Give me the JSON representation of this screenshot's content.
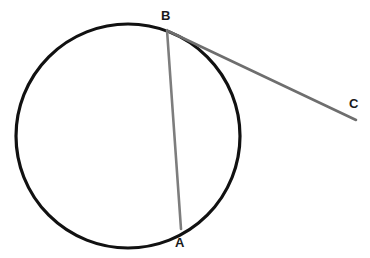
{
  "figure": {
    "type": "geometry-diagram",
    "background_color": "#ffffff",
    "width": 370,
    "height": 258
  },
  "labels": {
    "a": "A",
    "b": "B",
    "c": "C"
  },
  "colors": {
    "circle_stroke": "#111111",
    "chord_stroke": "#7d7d7d",
    "tangent_stroke": "#6e6e6e",
    "label_text": "#1a1a1a"
  },
  "geometry": {
    "circle": {
      "name": "circle",
      "cx": 128,
      "cy": 136,
      "r": 112,
      "stroke_width": 3.2
    },
    "chord_ab": {
      "name": "chord-AB",
      "x1": 167,
      "y1": 30,
      "x2": 181,
      "y2": 229,
      "stroke_width": 2.6
    },
    "tangent_bc": {
      "name": "tangent-BC",
      "x1": 168,
      "y1": 31,
      "x2": 356,
      "y2": 120,
      "stroke_width": 2.6
    },
    "points": {
      "a": {
        "x": 181,
        "y": 229
      },
      "b": {
        "x": 167,
        "y": 30
      },
      "c": {
        "x": 356,
        "y": 120
      }
    }
  }
}
